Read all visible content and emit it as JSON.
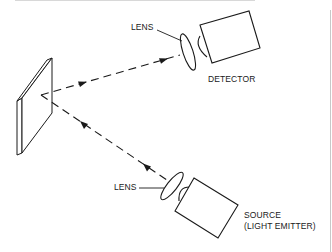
{
  "diagram": {
    "type": "optical reflective sensor schematic",
    "colors": {
      "line": "#1a1a1a",
      "border": "#cfcfcf",
      "background": "#ffffff"
    },
    "components": {
      "reflector": {
        "name": "reflecting surface"
      },
      "detector": {
        "label": "DETECTOR",
        "lens_label": "LENS"
      },
      "source": {
        "label_line1": "SOURCE",
        "label_line2": "(LIGHT EMITTER)",
        "lens_label": "LENS"
      }
    },
    "beams": [
      {
        "from": "source",
        "to": "reflector",
        "style": "dashed",
        "arrows": 2
      },
      {
        "from": "reflector",
        "to": "detector",
        "style": "dashed",
        "arrows": 2
      }
    ]
  }
}
